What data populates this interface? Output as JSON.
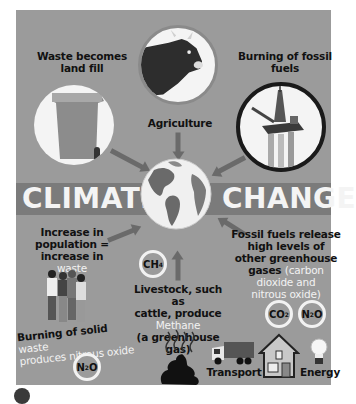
{
  "infographic": {
    "title_left": "CLIMATE",
    "title_right": "CHANGE",
    "colors": {
      "panel_bg": "#9b9b9b",
      "banner_bg": "#7b7b7b",
      "highlight_text": "#f2f2f2",
      "label_text": "#111111",
      "arrow": "#6a6a6a"
    },
    "top": {
      "waste": {
        "label": "Waste becomes land fill",
        "icon": "wheelie-bin-icon"
      },
      "agriculture": {
        "label": "Agriculture",
        "icon": "cow-icon"
      },
      "fossil_fuels": {
        "label": "Burning of fossil fuels",
        "icon": "oil-rig-icon"
      }
    },
    "center": {
      "icon": "globe-icon"
    },
    "bottom_left": {
      "population_line1": "Increase in",
      "population_line2": "population =",
      "population_line3": "increase in",
      "population_highlight": "waste",
      "people_icon": "crowd-icon",
      "burning_dark": "Burning of solid",
      "burning_highlight_1": "waste",
      "burning_highlight_2": "produces nitrous oxide",
      "gas": {
        "formula": "N",
        "sub": "2",
        "rest": "O"
      }
    },
    "bottom_center": {
      "gas": {
        "formula": "CH",
        "sub": "4"
      },
      "line1": "Livestock, such as",
      "line2": "cattle, produce",
      "highlight": "Methane",
      "line4": "(a greenhouse gas)",
      "icon": "dung-icon"
    },
    "bottom_right": {
      "line1": "Fossil fuels release",
      "line2": "high levels of",
      "line3": "other greenhouse",
      "line4_dark": "gases",
      "line4_highlight": "(carbon",
      "line5_highlight": "dioxide and",
      "line6_highlight": "nitrous oxide)",
      "gases": [
        {
          "formula": "CO",
          "sub": "2",
          "rest": ""
        },
        {
          "formula": "N",
          "sub": "2",
          "rest": "O"
        }
      ],
      "sources": [
        {
          "label": "Transport",
          "icon": "truck-icon"
        },
        {
          "label": "",
          "icon": "house-icon"
        },
        {
          "label": "Energy",
          "icon": "light-bulb-icon"
        }
      ]
    }
  }
}
